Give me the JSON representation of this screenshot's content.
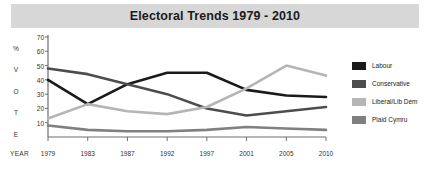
{
  "header": {
    "title": "Electoral Trends 1979 - 2010"
  },
  "axes": {
    "y_caption_letters": [
      "%",
      "V",
      "O",
      "T",
      "E"
    ],
    "y_ticks": [
      70,
      60,
      50,
      40,
      30,
      20,
      10
    ],
    "x_caption": "YEAR"
  },
  "legend": {
    "items": [
      {
        "label": "Labour",
        "color": "#1a1a1a"
      },
      {
        "label": "Conservative",
        "color": "#4d4d4d"
      },
      {
        "label": "Liberal/Lib Dem",
        "color": "#b5b5b5"
      },
      {
        "label": "Plaid Cymru",
        "color": "#808080"
      }
    ]
  },
  "chart_data": {
    "type": "line",
    "title": "Electoral Trends 1979 - 2010",
    "xlabel": "YEAR",
    "ylabel": "% VOTE",
    "categories": [
      1979,
      1983,
      1987,
      1992,
      1997,
      2001,
      2005,
      2010
    ],
    "x": [
      "1979",
      "1983",
      "1987",
      "1992",
      "1997",
      "2001",
      "2005",
      "2010"
    ],
    "ylim": [
      0,
      70
    ],
    "yticks": [
      10,
      20,
      30,
      40,
      50,
      60,
      70
    ],
    "grid": false,
    "legend_position": "right",
    "series": [
      {
        "name": "Labour",
        "color": "#1a1a1a",
        "values": [
          40,
          23,
          37,
          45,
          45,
          33,
          29,
          28
        ]
      },
      {
        "name": "Conservative",
        "color": "#4d4d4d",
        "values": [
          48,
          44,
          37,
          30,
          20,
          15,
          18,
          21
        ]
      },
      {
        "name": "Liberal/Lib Dem",
        "color": "#b5b5b5",
        "values": [
          13,
          23,
          18,
          16,
          21,
          34,
          50,
          43
        ]
      },
      {
        "name": "Plaid Cymru",
        "color": "#808080",
        "values": [
          8,
          5,
          4,
          4,
          5,
          7,
          6,
          5
        ]
      }
    ]
  }
}
